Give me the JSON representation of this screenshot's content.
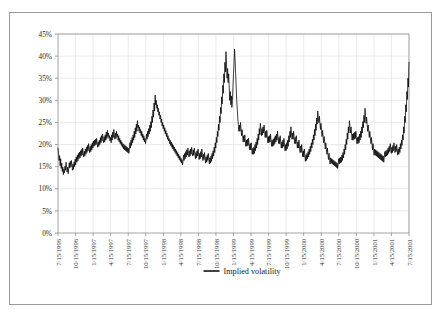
{
  "chart_data": {
    "type": "line",
    "title": "",
    "xlabel": "",
    "ylabel": "",
    "ylim": [
      0,
      0.45
    ],
    "ytick_labels": [
      "0%",
      "5%",
      "10%",
      "15%",
      "20%",
      "25%",
      "30%",
      "35%",
      "40%",
      "45%"
    ],
    "ytick_values": [
      0,
      5,
      10,
      15,
      20,
      25,
      30,
      35,
      40,
      45
    ],
    "grid": true,
    "legend_position": "bottom-center",
    "legend": [
      "Implied volatility"
    ],
    "series": [
      {
        "name": "Implied volatility",
        "color": "#000000",
        "x_start": "7/15/1996",
        "x_end": "9/15/2001",
        "values": [
          19.2,
          18.0,
          16.4,
          17.5,
          15.2,
          16.8,
          14.6,
          15.8,
          13.9,
          14.9,
          13.2,
          14.4,
          13.6,
          15.1,
          14.2,
          16.0,
          14.8,
          13.8,
          14.9,
          13.4,
          14.6,
          15.9,
          14.7,
          16.2,
          15.0,
          16.4,
          15.3,
          14.2,
          15.6,
          14.4,
          16.1,
          15.0,
          16.7,
          15.4,
          17.2,
          16.0,
          17.6,
          16.3,
          18.0,
          16.8,
          18.3,
          17.0,
          18.6,
          17.4,
          18.9,
          17.6,
          19.2,
          18.0,
          17.2,
          18.5,
          17.4,
          19.0,
          17.8,
          19.4,
          18.2,
          19.8,
          18.6,
          20.2,
          19.0,
          18.2,
          19.6,
          18.4,
          20.0,
          18.8,
          20.4,
          19.2,
          20.8,
          19.6,
          21.0,
          19.8,
          21.2,
          20.0,
          21.4,
          20.2,
          19.4,
          20.6,
          19.6,
          21.0,
          20.0,
          21.6,
          20.4,
          22.0,
          20.8,
          22.4,
          21.2,
          20.4,
          21.8,
          20.6,
          22.2,
          21.0,
          22.8,
          21.4,
          23.2,
          21.8,
          22.6,
          21.4,
          22.0,
          20.8,
          21.6,
          20.4,
          22.2,
          21.0,
          22.8,
          21.6,
          23.4,
          22.0,
          21.2,
          22.6,
          21.4,
          23.0,
          21.8,
          22.4,
          21.0,
          22.0,
          20.6,
          21.4,
          20.2,
          21.0,
          19.8,
          20.6,
          19.4,
          20.2,
          19.0,
          20.0,
          18.8,
          19.8,
          18.6,
          19.6,
          18.4,
          19.4,
          18.2,
          19.2,
          18.0,
          19.0,
          20.4,
          19.2,
          21.0,
          19.8,
          21.6,
          20.4,
          22.2,
          21.0,
          23.0,
          21.6,
          23.8,
          22.4,
          24.6,
          23.0,
          25.4,
          23.8,
          24.4,
          23.0,
          24.0,
          22.6,
          23.4,
          22.0,
          23.0,
          21.6,
          22.4,
          21.0,
          22.0,
          20.6,
          21.4,
          20.2,
          21.0,
          22.4,
          21.2,
          23.0,
          21.8,
          23.6,
          22.4,
          24.4,
          23.0,
          25.2,
          23.8,
          26.4,
          25.0,
          27.8,
          26.2,
          29.4,
          27.6,
          31.2,
          29.0,
          30.0,
          28.2,
          29.0,
          27.4,
          28.2,
          26.6,
          27.4,
          25.8,
          26.6,
          25.0,
          25.8,
          24.2,
          25.0,
          23.6,
          24.4,
          23.0,
          23.8,
          22.4,
          23.2,
          21.8,
          22.6,
          21.2,
          22.0,
          20.8,
          21.4,
          20.2,
          21.0,
          19.8,
          20.6,
          19.4,
          20.2,
          19.0,
          19.8,
          18.6,
          19.4,
          18.2,
          19.0,
          17.8,
          18.6,
          17.4,
          18.2,
          17.0,
          17.8,
          16.6,
          17.4,
          16.2,
          17.0,
          15.8,
          16.6,
          15.4,
          16.2,
          17.6,
          16.4,
          18.0,
          16.8,
          18.4,
          17.2,
          18.8,
          17.6,
          19.2,
          18.0,
          17.2,
          18.6,
          17.4,
          19.0,
          17.8,
          19.4,
          18.2,
          17.4,
          18.8,
          17.6,
          19.2,
          18.0,
          16.8,
          18.2,
          17.0,
          18.6,
          17.4,
          19.0,
          17.8,
          16.6,
          18.0,
          16.8,
          18.4,
          17.2,
          19.0,
          17.8,
          16.4,
          17.8,
          16.6,
          18.2,
          17.0,
          15.8,
          17.2,
          16.0,
          17.6,
          16.4,
          18.0,
          16.8,
          15.6,
          17.0,
          15.8,
          17.4,
          16.2,
          18.0,
          16.8,
          18.6,
          17.4,
          19.4,
          18.2,
          20.4,
          19.2,
          21.6,
          20.4,
          23.0,
          21.8,
          24.6,
          23.2,
          26.4,
          25.0,
          28.4,
          27.0,
          30.8,
          29.2,
          33.4,
          31.6,
          36.0,
          34.0,
          38.6,
          36.4,
          41.0,
          38.0,
          35.0,
          37.2,
          34.0,
          36.0,
          33.0,
          30.0,
          32.0,
          29.0,
          31.0,
          28.4,
          30.0,
          33.0,
          36.0,
          38.6,
          41.6,
          39.0,
          36.0,
          33.0,
          30.0,
          28.0,
          26.0,
          24.4,
          23.0,
          24.4,
          23.0,
          25.0,
          23.6,
          22.0,
          23.4,
          22.0,
          20.6,
          22.0,
          20.6,
          22.2,
          20.8,
          19.6,
          21.0,
          19.6,
          21.2,
          19.8,
          21.4,
          20.0,
          18.8,
          20.2,
          18.8,
          20.4,
          19.0,
          17.8,
          19.2,
          17.8,
          19.4,
          18.0,
          20.0,
          18.6,
          20.6,
          19.2,
          21.4,
          20.0,
          22.4,
          21.0,
          23.6,
          22.2,
          24.8,
          23.4,
          22.0,
          23.6,
          22.2,
          24.0,
          22.6,
          24.4,
          23.0,
          21.6,
          23.0,
          21.6,
          23.2,
          21.8,
          20.4,
          21.8,
          20.4,
          22.0,
          20.6,
          22.4,
          21.0,
          19.6,
          21.0,
          19.6,
          21.2,
          19.8,
          21.6,
          20.2,
          22.0,
          20.6,
          22.4,
          21.0,
          23.0,
          21.6,
          20.2,
          21.6,
          20.2,
          22.0,
          20.6,
          19.2,
          20.6,
          19.2,
          21.0,
          19.6,
          21.4,
          20.0,
          18.6,
          20.0,
          18.6,
          20.4,
          19.0,
          21.0,
          19.6,
          22.0,
          20.6,
          23.0,
          21.6,
          24.0,
          22.6,
          21.2,
          22.6,
          21.2,
          23.0,
          21.6,
          20.2,
          21.6,
          20.2,
          22.0,
          20.6,
          19.2,
          20.6,
          19.2,
          21.0,
          19.6,
          18.2,
          19.6,
          18.2,
          20.0,
          18.6,
          17.2,
          18.6,
          17.2,
          19.0,
          17.6,
          16.2,
          17.6,
          16.4,
          18.0,
          16.8,
          18.4,
          17.2,
          19.0,
          17.8,
          19.6,
          18.4,
          20.4,
          19.2,
          21.2,
          20.0,
          22.2,
          21.0,
          23.4,
          22.0,
          24.6,
          23.2,
          26.0,
          24.6,
          27.6,
          26.0,
          25.0,
          26.4,
          24.8,
          23.4,
          24.8,
          23.2,
          21.8,
          23.2,
          21.8,
          20.4,
          21.8,
          20.4,
          19.0,
          20.4,
          19.0,
          17.8,
          19.2,
          17.8,
          16.6,
          18.0,
          16.8,
          15.6,
          17.0,
          15.8,
          16.8,
          15.6,
          16.6,
          15.4,
          16.4,
          15.2,
          16.2,
          15.0,
          16.0,
          14.8,
          15.8,
          14.6,
          15.6,
          16.8,
          15.6,
          17.0,
          15.8,
          17.2,
          16.0,
          17.6,
          16.4,
          18.2,
          17.0,
          19.0,
          17.8,
          20.0,
          18.8,
          21.2,
          20.0,
          22.6,
          21.2,
          24.0,
          22.6,
          25.4,
          24.0,
          22.6,
          24.0,
          22.4,
          21.0,
          22.4,
          21.0,
          22.6,
          21.2,
          22.8,
          21.4,
          23.0,
          21.6,
          20.2,
          21.6,
          20.2,
          21.8,
          20.4,
          22.4,
          21.0,
          23.0,
          21.6,
          24.0,
          22.6,
          25.2,
          23.8,
          26.6,
          25.0,
          28.2,
          26.6,
          24.8,
          26.2,
          24.6,
          23.0,
          24.4,
          23.0,
          21.6,
          23.0,
          21.6,
          20.2,
          21.6,
          20.2,
          18.8,
          20.2,
          18.8,
          17.6,
          19.0,
          17.6,
          18.8,
          17.4,
          18.6,
          17.2,
          18.4,
          17.0,
          18.2,
          16.8,
          18.0,
          16.6,
          17.8,
          16.4,
          17.6,
          16.2,
          17.4,
          16.0,
          17.2,
          18.4,
          17.2,
          18.6,
          17.4,
          18.8,
          17.6,
          19.2,
          18.0,
          19.6,
          18.4,
          20.2,
          19.0,
          18.0,
          19.4,
          18.2,
          19.8,
          18.6,
          20.4,
          19.2,
          18.2,
          19.6,
          18.4,
          20.0,
          18.8,
          17.6,
          19.0,
          17.8,
          19.4,
          18.2,
          20.2,
          19.0,
          21.0,
          19.8,
          22.2,
          21.0,
          24.0,
          22.6,
          26.4,
          25.0,
          29.0,
          27.4,
          32.0,
          30.2,
          35.0,
          33.0,
          38.6
        ]
      }
    ],
    "xtick_labels": [
      "7/15/1996",
      "10/15/1996",
      "1/15/1997",
      "4/15/1997",
      "7/15/1997",
      "10/15/1997",
      "1/15/1998",
      "4/15/1998",
      "7/15/1998",
      "10/15/1998",
      "1/15/1999",
      "4/15/1999",
      "7/15/1999",
      "10/15/1999",
      "1/15/2000",
      "4/15/2000",
      "7/15/2000",
      "10/15/2000",
      "1/15/2001",
      "4/15/2001",
      "7/15/2001"
    ]
  },
  "colors": {
    "series": "#000000",
    "grid": "#e2e2e2",
    "axis": "#8e8e8e",
    "frame": "#9a9a9a",
    "background": "#ffffff"
  }
}
